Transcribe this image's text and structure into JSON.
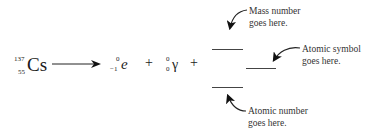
{
  "equation": {
    "reactant": {
      "mass_number": "137",
      "atomic_number": "55",
      "symbol": "Cs"
    },
    "arrow": "reaction-arrow",
    "products": [
      {
        "mass_number": "0",
        "atomic_number": "−1",
        "symbol": "e"
      },
      {
        "mass_number": "0",
        "atomic_number": "0",
        "symbol": "γ"
      }
    ],
    "plus": "+"
  },
  "annotations": {
    "mass_number": [
      "Mass number",
      "goes here."
    ],
    "atomic_symbol": [
      "Atomic symbol",
      "goes here."
    ],
    "atomic_number": [
      "Atomic number",
      "goes here."
    ]
  }
}
